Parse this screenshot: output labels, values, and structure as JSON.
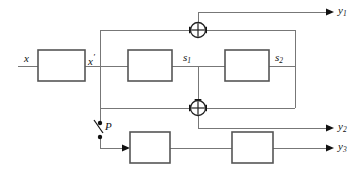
{
  "diagram": {
    "background_color": "#ffffff",
    "wire_color": "#777777",
    "block_stroke_color": "#555555",
    "marker_color": "#111111"
  },
  "labels": {
    "input_x": "x",
    "node_x_prime_base": "x",
    "node_x_prime_mark": "′",
    "state_s1_base": "s",
    "state_s1_sub": "1",
    "state_s2_base": "s",
    "state_s2_sub": "2",
    "switch_p": "P",
    "output_y1_base": "y",
    "output_y1_sub": "1",
    "output_y2_base": "y",
    "output_y2_sub": "2",
    "output_y3_base": "y",
    "output_y3_sub": "3"
  },
  "blocks": [
    {
      "id": "block-input",
      "x": 38,
      "y": 50,
      "width": 47,
      "height": 31
    },
    {
      "id": "block-delay-1",
      "x": 128,
      "y": 50,
      "width": 44,
      "height": 31
    },
    {
      "id": "block-delay-2",
      "x": 225,
      "y": 50,
      "width": 44,
      "height": 31
    },
    {
      "id": "block-lower-1",
      "x": 130,
      "y": 132,
      "width": 40,
      "height": 31
    },
    {
      "id": "block-lower-2",
      "x": 232,
      "y": 132,
      "width": 41,
      "height": 31
    }
  ],
  "adders": [
    {
      "id": "adder-top",
      "cx": 198,
      "cy": 30,
      "r": 7.5,
      "inputs": [
        "left",
        "right"
      ],
      "operator": "plus"
    },
    {
      "id": "adder-bottom",
      "cx": 198,
      "cy": 108,
      "r": 7.5,
      "inputs": [
        "left",
        "right",
        "top"
      ],
      "operator": "plus"
    }
  ],
  "switch": {
    "id": "switch-p",
    "label": "P",
    "x": 100,
    "upper_contact_y": 123,
    "lower_contact_y": 137,
    "state": "open"
  },
  "outputs": [
    {
      "name": "y1",
      "x": 336,
      "y": 12
    },
    {
      "name": "y2",
      "x": 336,
      "y": 128
    },
    {
      "name": "y3",
      "x": 336,
      "y": 148
    }
  ]
}
